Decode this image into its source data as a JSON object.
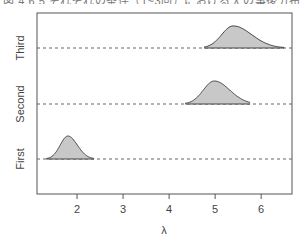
{
  "caption": "図 4.6.5  それぞれの条件（1~3回）における λ の事後分布",
  "chart_data": {
    "type": "ridgeline-density",
    "title": "",
    "xlabel": "λ",
    "ylabel": "",
    "xlim": [
      1.13,
      6.67
    ],
    "xticks": [
      2,
      3,
      4,
      5,
      6
    ],
    "tick_labels": [
      "2",
      "3",
      "4",
      "5",
      "6"
    ],
    "grid": false,
    "legend": null,
    "categories": [
      "First",
      "Second",
      "Third"
    ],
    "series": [
      {
        "name": "First",
        "mode": 1.8,
        "range": [
          1.33,
          2.37
        ],
        "sd": 0.18,
        "skew": 0.15,
        "relative_height": 1.0
      },
      {
        "name": "Second",
        "mode": 4.98,
        "range": [
          4.35,
          5.76
        ],
        "sd": 0.27,
        "skew": 0.25,
        "relative_height": 1.0
      },
      {
        "name": "Third",
        "mode": 5.39,
        "range": [
          4.76,
          6.5
        ],
        "sd": 0.3,
        "skew": 0.35,
        "relative_height": 0.96
      }
    ],
    "fill_color": "#c8c8c8",
    "line_color": "#444444",
    "baseline_style": "dashed"
  }
}
